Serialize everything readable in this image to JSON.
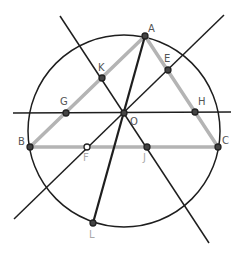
{
  "diagram": {
    "colors": {
      "line": "#1e1e1e",
      "triangle": "#b4b4b4",
      "label": "#555555",
      "label_muted": "#aaaaaa"
    },
    "circle": {
      "cx": 124,
      "cy": 131,
      "r": 96
    },
    "points": {
      "A": {
        "label": "A",
        "x": 145,
        "y": 36
      },
      "B": {
        "label": "B",
        "x": 30,
        "y": 147
      },
      "C": {
        "label": "C",
        "x": 218,
        "y": 147
      },
      "O": {
        "label": "O",
        "x": 124,
        "y": 113
      },
      "E": {
        "label": "E",
        "x": 168,
        "y": 70
      },
      "K": {
        "label": "K",
        "x": 102,
        "y": 78
      },
      "G": {
        "label": "G",
        "x": 66,
        "y": 113
      },
      "H": {
        "label": "H",
        "x": 195,
        "y": 112
      },
      "F": {
        "label": "F",
        "x": 87,
        "y": 147
      },
      "J": {
        "label": "J",
        "x": 147,
        "y": 147
      },
      "L": {
        "label": "L",
        "x": 93,
        "y": 223
      }
    },
    "lines": [
      {
        "name": "line-through-K-O-J",
        "x1": 60,
        "y1": 16,
        "x2": 209,
        "y2": 243
      },
      {
        "name": "line-through-E-O-F",
        "x1": 224,
        "y1": 15,
        "x2": 14,
        "y2": 219
      },
      {
        "name": "line-through-G-O-H",
        "x1": 13,
        "y1": 113,
        "x2": 231,
        "y2": 112
      },
      {
        "name": "segment-A-L",
        "x1": 145,
        "y1": 36,
        "x2": 93,
        "y2": 223
      }
    ]
  }
}
